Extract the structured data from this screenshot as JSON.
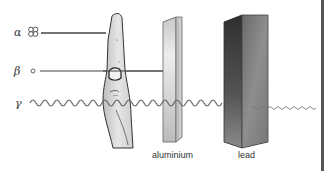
{
  "diagram": {
    "radiations": [
      {
        "symbol": "α",
        "name": "alpha",
        "particle": "helium-nucleus-cluster",
        "stopped_by": "hand"
      },
      {
        "symbol": "β",
        "name": "beta",
        "particle": "small-circle",
        "stopped_by": "aluminium"
      },
      {
        "symbol": "γ",
        "name": "gamma",
        "particle": "wave",
        "stopped_by": "lead (partially, continues weakened)"
      }
    ],
    "barriers": [
      {
        "name": "hand",
        "label": ""
      },
      {
        "name": "aluminium",
        "label": "aluminium"
      },
      {
        "name": "lead",
        "label": "lead"
      }
    ],
    "colors": {
      "line": "#444444",
      "wave": "#666666",
      "aluminium_light": "#e0e0e0",
      "aluminium_dark": "#9a9a9a",
      "lead_dark": "#3a3a3a",
      "lead_mid": "#7a7a7a",
      "hand": "#d8d8d8"
    }
  }
}
